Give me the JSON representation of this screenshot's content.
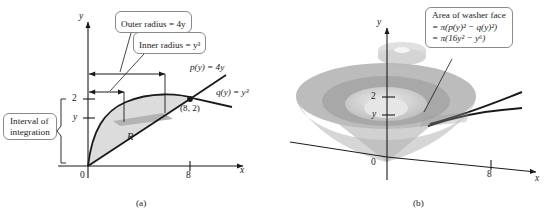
{
  "figure": {
    "type": "calculus-washer-method-diagram",
    "panels": [
      {
        "id": "a",
        "caption": "(a)",
        "description": "Region R in the xy-plane bounded by p(y)=4y and q(y)=y^3, with outer and inner radius dimension arrows",
        "callouts": [
          {
            "name": "outer-radius",
            "text": "Outer radius = 4y"
          },
          {
            "name": "inner-radius",
            "text": "Inner radius = y³"
          },
          {
            "name": "interval-of-integration",
            "line1": "Interval of",
            "line2": "integration"
          }
        ],
        "curve_labels": [
          {
            "name": "p-of-y",
            "text": "p(y) = 4y"
          },
          {
            "name": "q-of-y",
            "text": "q(y) = y³"
          }
        ],
        "region_label": "R",
        "point_label": "(8, 2)",
        "axes": {
          "x_label": "x",
          "y_label": "y",
          "origin_label": "0",
          "x_ticks": [
            "8"
          ],
          "y_ticks": [
            "2",
            "y"
          ]
        }
      },
      {
        "id": "b",
        "caption": "(b)",
        "description": "Solid of revolution (washer) generated by revolving R about the y-axis, with a representative washer slice",
        "callouts": [
          {
            "name": "area-of-washer-face",
            "line1": "Area of washer face",
            "line2": "= π(p(y)² − q(y)²)",
            "line3": "= π(16y² − y⁶)"
          }
        ],
        "axes": {
          "x_label": "x",
          "y_label": "y",
          "origin_label": "0",
          "x_ticks": [
            "8"
          ],
          "y_ticks": [
            "2",
            "y"
          ]
        }
      }
    ]
  },
  "colors": {
    "ink": "#1a1a1a",
    "axis": "#333333",
    "callout_border": "#8a8a8a",
    "region_fill": "#dcdcdc",
    "strip_fill": "#b4b4b4",
    "solid_outer": "#b9b9b9",
    "solid_mid": "#a6a6a6",
    "solid_inner": "#cfcfcf",
    "solid_core": "#e2e2e2",
    "cone_shadow": "#c8c8c8"
  }
}
